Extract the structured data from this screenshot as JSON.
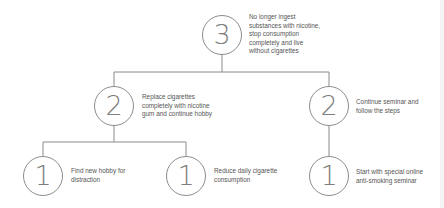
{
  "diagram": {
    "nodes": [
      {
        "id": "top",
        "level": 3,
        "text": "No longer ingest\nsubstances with nicotine,\nstop consumption\ncompletely and live\nwithout cigarettes"
      },
      {
        "id": "mid-left",
        "level": 2,
        "text": "Replace cigarettes\ncompletely with nicotine\ngum and continue hobby"
      },
      {
        "id": "mid-right",
        "level": 2,
        "text": "Continue seminar and\nfollow the steps"
      },
      {
        "id": "bottom-left",
        "level": 1,
        "text": "Find new hobby for\ndistraction"
      },
      {
        "id": "bottom-middle",
        "level": 1,
        "text": "Reduce daily cigarette\nconsumption"
      },
      {
        "id": "bottom-right",
        "level": 1,
        "text": "Start with special online\nanti-smoking seminar"
      }
    ],
    "edges": [
      {
        "from": "top",
        "to": "mid-left"
      },
      {
        "from": "top",
        "to": "mid-right"
      },
      {
        "from": "mid-left",
        "to": "bottom-left"
      },
      {
        "from": "mid-left",
        "to": "bottom-middle"
      },
      {
        "from": "mid-right",
        "to": "bottom-right"
      }
    ],
    "colors": {
      "stroke": "#8c8c8c",
      "number": "#7d7d7d",
      "text": "#555555"
    }
  }
}
